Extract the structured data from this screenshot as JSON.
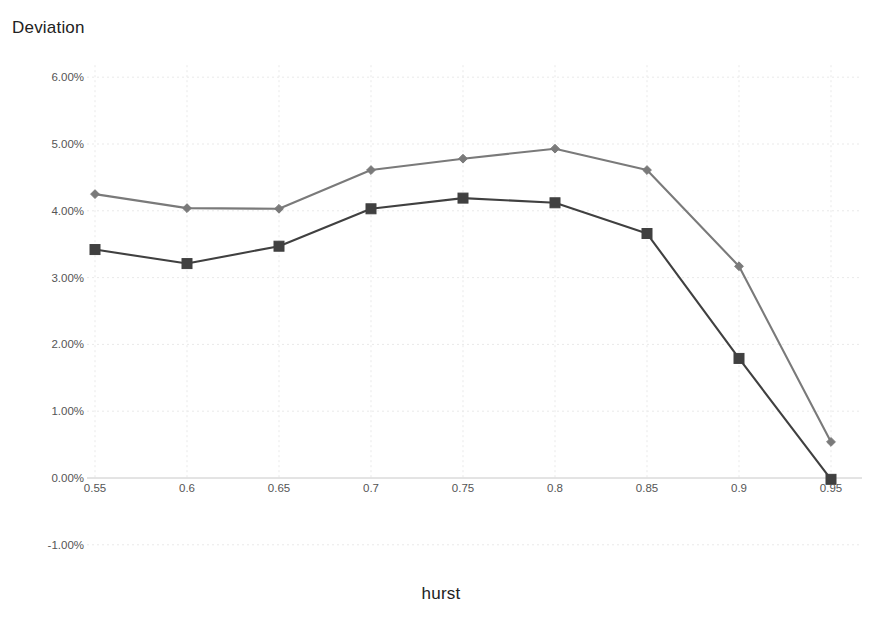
{
  "chart_data": {
    "type": "line",
    "title": "",
    "ylabel": "Deviation",
    "xlabel": "hurst",
    "x": [
      0.55,
      0.6,
      0.65,
      0.7,
      0.75,
      0.8,
      0.85,
      0.9,
      0.95
    ],
    "x_tick_labels": [
      "0.55",
      "0.6",
      "0.65",
      "0.7",
      "0.75",
      "0.8",
      "0.85",
      "0.9",
      "0.95"
    ],
    "y_tick_labels": [
      "6.00%",
      "5.00%",
      "4.00%",
      "3.00%",
      "2.00%",
      "1.00%",
      "0.00%",
      "-1.00%"
    ],
    "y_tick_values": [
      6,
      5,
      4,
      3,
      2,
      1,
      0,
      -1
    ],
    "ylim": [
      -1.0,
      6.0
    ],
    "xlim": [
      0.55,
      0.95
    ],
    "grid": true,
    "legend": "none",
    "series": [
      {
        "name": "upper-series",
        "marker": "diamond",
        "color": "#7a7a7a",
        "values": [
          4.25,
          4.04,
          4.03,
          4.61,
          4.78,
          4.93,
          4.61,
          3.17,
          0.54
        ]
      },
      {
        "name": "lower-series",
        "marker": "square",
        "color": "#404040",
        "values": [
          3.42,
          3.21,
          3.47,
          4.03,
          4.19,
          4.12,
          3.66,
          1.79,
          -0.02
        ]
      }
    ]
  },
  "axes": {
    "y_axis_title": "Deviation",
    "x_axis_title": "hurst"
  },
  "colors": {
    "background": "#ffffff",
    "grid": "#e9e9e9",
    "axis": "#c8c8c8",
    "tick_text": "#555555",
    "title_text": "#222222"
  }
}
